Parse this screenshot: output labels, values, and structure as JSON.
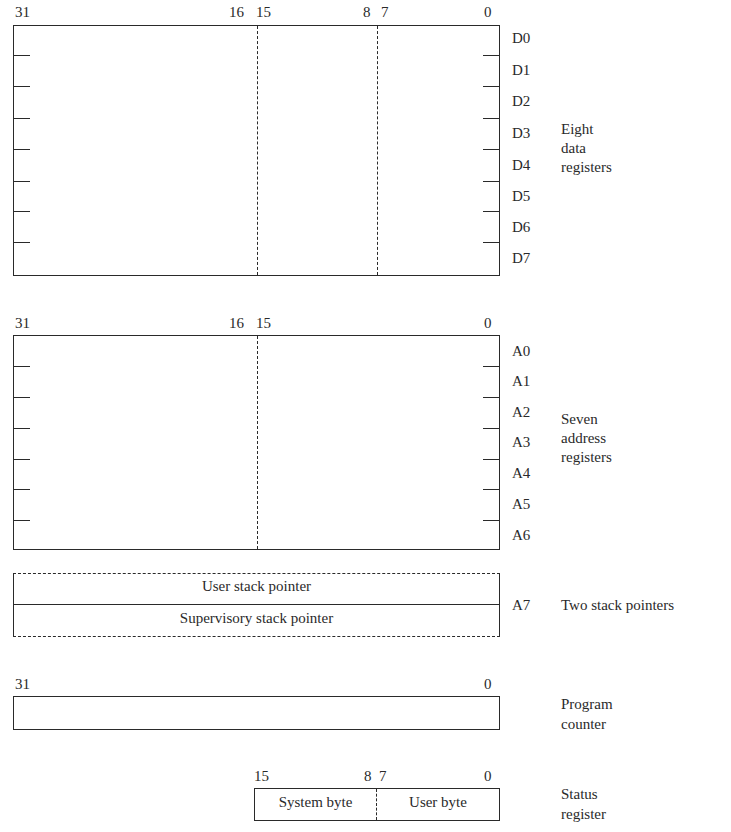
{
  "data_registers": {
    "bit_labels": {
      "b31": "31",
      "b16": "16",
      "b15": "15",
      "b8": "8",
      "b7": "7",
      "b0": "0"
    },
    "names": [
      "D0",
      "D1",
      "D2",
      "D3",
      "D4",
      "D5",
      "D6",
      "D7"
    ],
    "description": [
      "Eight",
      "data",
      "registers"
    ]
  },
  "address_registers": {
    "bit_labels": {
      "b31": "31",
      "b16": "16",
      "b15": "15",
      "b0": "0"
    },
    "names": [
      "A0",
      "A1",
      "A2",
      "A3",
      "A4",
      "A5",
      "A6"
    ],
    "description": [
      "Seven",
      "address",
      "registers"
    ]
  },
  "stack_pointers": {
    "user": "User stack pointer",
    "supervisory": "Supervisory stack pointer",
    "name": "A7",
    "description": "Two stack pointers"
  },
  "program_counter": {
    "bit_labels": {
      "b31": "31",
      "b0": "0"
    },
    "description": [
      "Program",
      "counter"
    ]
  },
  "status_register": {
    "bit_labels": {
      "b15": "15",
      "b8": "8",
      "b7": "7",
      "b0": "0"
    },
    "system_byte": "System byte",
    "user_byte": "User byte",
    "description": [
      "Status",
      "register"
    ]
  }
}
